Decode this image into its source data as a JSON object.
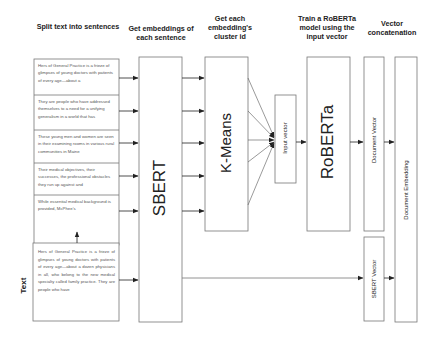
{
  "headers": {
    "split": "Split text into sentences",
    "embed": "Get embeddings of each sentence",
    "cluster": "Get each embedding's cluster id",
    "train": "Train a RoBERTa model using the input vector",
    "concat": "Vector concatenation"
  },
  "sentences": [
    "Hers of General Practice is a frieze of glimpses of young doctors with patients of every age—about a",
    "They are people who have addressed themselves to a need for a unifying generalism in a world that has",
    "These young men and women are seen in their examining rooms in various rural communities in Maine",
    "Their medical objectives, their successes, the professional obstacles they run up against and",
    "While essential medical background is provided, McPhee's"
  ],
  "input_text": {
    "label": "Text",
    "body": "Hers of General Practice is a frieze of glimpses of young doctors with patients of every age—about a dozen physicians in all, who belong to the new medical specialty called family practice. They are people who have"
  },
  "blocks": {
    "sbert": "SBERT",
    "kmeans": "K-Means",
    "input_vector": "Input vector",
    "roberta": "RoBERTa",
    "document_vector": "Document Vector",
    "sbert_vector": "SBERT Vector",
    "document_embedding": "Document Embedding"
  },
  "colors": {
    "stroke": "#777777",
    "arrow": "#222222",
    "text": "#222222",
    "light_text": "#555555"
  }
}
